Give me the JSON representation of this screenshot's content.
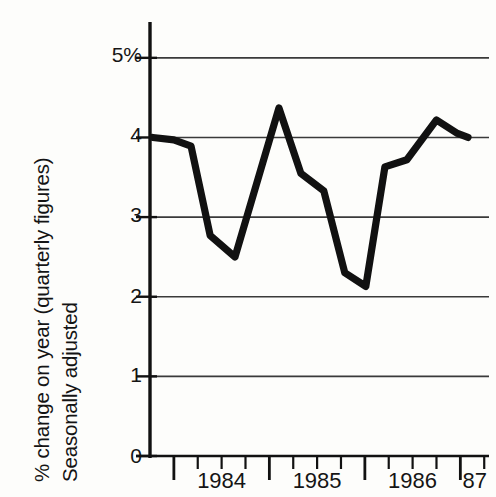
{
  "chart_data": {
    "type": "line",
    "title": "",
    "subtitle": "",
    "ylabel_line1": "% change on year (quarterly figures)",
    "ylabel_line2": "Seasonally adjusted",
    "xlabel": "",
    "ylim": [
      0,
      5.45
    ],
    "xlim": [
      1983.75,
      1987.3
    ],
    "grid": true,
    "grid_axis": "y",
    "legend": "none",
    "series_color": "#111111",
    "grid_color": "#3a3a3a",
    "axis_color": "#111111",
    "background": "#fdfdfb",
    "ytick_values": [
      0,
      1,
      2,
      3,
      4,
      5
    ],
    "ytick_labels": [
      "0",
      "1",
      "2",
      "3",
      "4",
      "5%"
    ],
    "xtick_labels": [
      "1984",
      "1985",
      "1986",
      "87"
    ],
    "xtick_label_positions": [
      1984.5,
      1985.5,
      1986.5,
      1987.15
    ],
    "x_major_ticks": [
      1984.0,
      1985.0,
      1986.0,
      1987.0
    ],
    "x_minor_ticks": [
      1984.25,
      1984.5,
      1984.75,
      1985.25,
      1985.5,
      1985.75,
      1986.25,
      1986.5,
      1986.75,
      1987.25
    ],
    "series": [
      {
        "name": "% change on year",
        "x": [
          1983.78,
          1984.0,
          1984.18,
          1984.38,
          1984.64,
          1985.1,
          1985.33,
          1985.57,
          1985.79,
          1986.01,
          1986.21,
          1986.44,
          1986.75,
          1986.97,
          1987.08
        ],
        "values": [
          4.0,
          3.97,
          3.89,
          2.77,
          2.5,
          4.37,
          3.55,
          3.33,
          2.3,
          2.13,
          3.63,
          3.72,
          4.22,
          4.05,
          4.0
        ]
      }
    ]
  },
  "axes": {
    "y_label_top": "5%",
    "y_label_4": "4",
    "y_label_3": "3",
    "y_label_2": "2",
    "y_label_1": "1",
    "y_label_0": "0"
  }
}
